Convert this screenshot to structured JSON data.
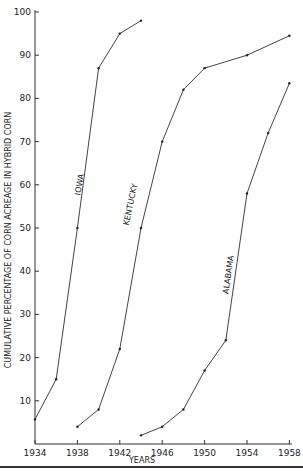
{
  "chart_data": {
    "type": "line",
    "title": "",
    "xlabel": "YEARS",
    "ylabel": "CUMULATIVE PERCENTAGE OF CORN ACREAGE IN HYBRID CORN",
    "x_ticks": [
      "1934",
      "1938",
      "1942",
      "1946",
      "1950",
      "1954",
      "1958"
    ],
    "y_ticks": [
      "10",
      "20",
      "30",
      "40",
      "50",
      "60",
      "70",
      "80",
      "90",
      "100"
    ],
    "xlim": [
      1934,
      1958
    ],
    "ylim": [
      0,
      100
    ],
    "grid": false,
    "legend": "inline labels on lines",
    "series": [
      {
        "name": "IOWA",
        "x": [
          1934,
          1936,
          1938,
          1940,
          1942,
          1944
        ],
        "values": [
          5.7,
          15,
          50,
          87,
          95,
          98
        ]
      },
      {
        "name": "KENTUCKY",
        "x": [
          1938,
          1940,
          1942,
          1944,
          1946,
          1948,
          1950,
          1954,
          1958
        ],
        "values": [
          4,
          8,
          22,
          50,
          70,
          82,
          87,
          90,
          94.5
        ]
      },
      {
        "name": "ALABAMA",
        "x": [
          1944,
          1946,
          1948,
          1950,
          1952,
          1954,
          1956,
          1958
        ],
        "values": [
          2,
          4,
          8,
          17,
          24,
          58,
          72,
          83.5
        ]
      }
    ]
  }
}
